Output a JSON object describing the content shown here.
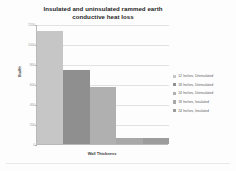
{
  "chart_data": {
    "type": "bar",
    "title": "Insulated and uninsulated rammed earth conductive heat loss",
    "title_lines": [
      "Insulated and uninsulated rammed earth",
      "conductive heat loss"
    ],
    "xlabel": "Wall Thickness",
    "ylabel": "Btu/Hr",
    "ylim": [
      0,
      1200
    ],
    "yticks": [
      0,
      200,
      400,
      600,
      800,
      1000,
      1200
    ],
    "ytick_labels": [
      "0",
      "200",
      "400",
      "600",
      "800",
      "1000",
      "1200"
    ],
    "grid": true,
    "legend_position": "right",
    "categories": [
      "12 Inches, Uninsulated",
      "18 Inches, Uninsulated",
      "24 Inches, Uninsulated",
      "18 Inches, Insulated",
      "24 Inches, Insulated"
    ],
    "values": [
      1130,
      740,
      570,
      65,
      65
    ],
    "colors": [
      "#c6c6c6",
      "#8f8f8f",
      "#b0b0b0",
      "#a8a8a8",
      "#9c9c9c"
    ],
    "bars": [
      {
        "label": "12 Inches, Uninsulated",
        "value": 1130,
        "color": "#c6c6c6"
      },
      {
        "label": "18 Inches, Uninsulated",
        "value": 740,
        "color": "#8f8f8f"
      },
      {
        "label": "24 Inches, Uninsulated",
        "value": 570,
        "color": "#b0b0b0"
      },
      {
        "label": "18 Inches, Insulated",
        "value": 65,
        "color": "#a8a8a8"
      },
      {
        "label": "24 Inches, Insulated",
        "value": 65,
        "color": "#9c9c9c"
      }
    ]
  },
  "legend": {
    "items": [
      {
        "label": "12 Inches, Uninsulated",
        "color": "#c6c6c6"
      },
      {
        "label": "18 Inches, Uninsulated",
        "color": "#8f8f8f"
      },
      {
        "label": "24 Inches, Uninsulated",
        "color": "#b0b0b0"
      },
      {
        "label": "18 Inches, Insulated",
        "color": "#a8a8a8"
      },
      {
        "label": "24 Inches, Insulated",
        "color": "#9c9c9c"
      }
    ]
  }
}
